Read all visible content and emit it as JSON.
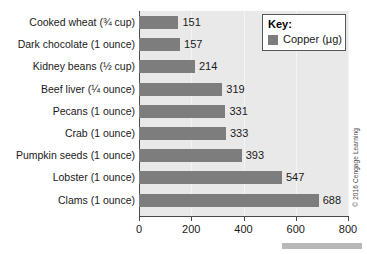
{
  "chart_data": {
    "type": "bar",
    "orientation": "horizontal",
    "title": "",
    "xlabel": "",
    "ylabel": "",
    "xlim": [
      0,
      800
    ],
    "xticks": [
      0,
      200,
      400,
      600,
      800
    ],
    "grid": true,
    "legend_position": "top-right",
    "categories": [
      "Cooked wheat (¾ cup)",
      "Dark chocolate (1 ounce)",
      "Kidney beans (½ cup)",
      "Beef liver (¼ ounce)",
      "Pecans (1 ounce)",
      "Crab (1 ounce)",
      "Pumpkin seeds (1 ounce)",
      "Lobster (1 ounce)",
      "Clams (1 ounce)"
    ],
    "values": [
      151,
      157,
      214,
      319,
      331,
      333,
      393,
      547,
      688
    ],
    "series": [
      {
        "name": "Copper (µg)",
        "values": [
          151,
          157,
          214,
          319,
          331,
          333,
          393,
          547,
          688
        ],
        "color": "#7d7d7d"
      }
    ]
  },
  "legend": {
    "title": "Key:",
    "entries": [
      {
        "label": "Copper (µg)",
        "color": "#7d7d7d"
      }
    ]
  },
  "credit": {
    "text": "© 2016 Cengage Learning"
  },
  "colors": {
    "bar": "#7d7d7d",
    "plot_background": "#e9e9e9",
    "axis": "#4a4a4a",
    "gridline": "#f4f4f4",
    "text": "#1a1a1a",
    "page_background": "#ffffff"
  }
}
